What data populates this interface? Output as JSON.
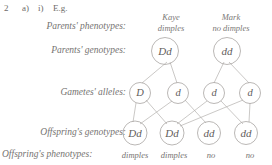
{
  "header": {
    "question_number": "2",
    "part_a": "a)",
    "part_i": "i)",
    "eg": "E.g."
  },
  "row_labels": {
    "parents_phenotypes": "Parents' phenotypes:",
    "parents_genotypes": "Parents' genotypes:",
    "gametes_alleles": "Gametes' alleles:",
    "offspring_genotypes": "Offspring's genotypes:",
    "offspring_phenotypes": "Offspring's phenotypes:"
  },
  "parents": [
    {
      "name": "Kaye",
      "phenotype": "dimples",
      "genotype": "Dd"
    },
    {
      "name": "Mark",
      "phenotype": "no dimples",
      "genotype": "dd"
    }
  ],
  "gametes": [
    {
      "allele": "D"
    },
    {
      "allele": "d"
    },
    {
      "allele": "d"
    },
    {
      "allele": "d"
    }
  ],
  "offspring": [
    {
      "genotype": "Dd",
      "phenotype": "dimples"
    },
    {
      "genotype": "Dd",
      "phenotype": "dimples"
    },
    {
      "genotype": "dd",
      "phenotype": "no"
    },
    {
      "genotype": "dd",
      "phenotype": "no"
    }
  ],
  "colors": {
    "text": "#73716f",
    "stroke": "#a8a5a2",
    "line": "#b3b0ad",
    "background": "#ffffff"
  }
}
